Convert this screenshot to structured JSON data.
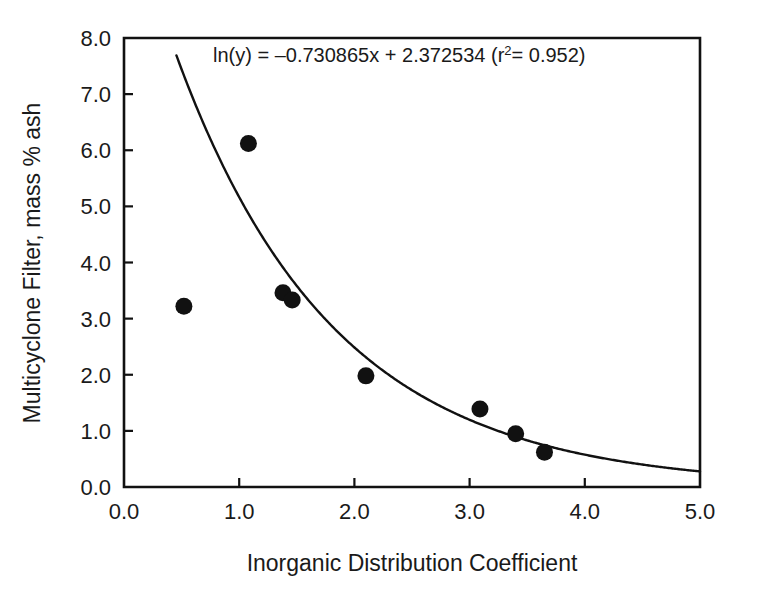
{
  "chart_data": {
    "type": "scatter",
    "title": "",
    "xlabel": "Inorganic Distribution Coefficient",
    "ylabel": "Multicyclone Filter, mass % ash",
    "xlim": [
      0.0,
      5.0
    ],
    "ylim": [
      0.0,
      8.0
    ],
    "xticks": [
      "0.0",
      "1.0",
      "2.0",
      "3.0",
      "4.0",
      "5.0"
    ],
    "xtick_values": [
      0.0,
      1.0,
      2.0,
      3.0,
      4.0,
      5.0
    ],
    "yticks": [
      "0.0",
      "1.0",
      "2.0",
      "3.0",
      "4.0",
      "5.0",
      "6.0",
      "7.0",
      "8.0"
    ],
    "ytick_values": [
      0.0,
      1.0,
      2.0,
      3.0,
      4.0,
      5.0,
      6.0,
      7.0,
      8.0
    ],
    "grid": false,
    "legend": "none",
    "points": [
      {
        "x": 0.52,
        "y": 3.22
      },
      {
        "x": 1.08,
        "y": 6.12
      },
      {
        "x": 1.38,
        "y": 3.46
      },
      {
        "x": 1.46,
        "y": 3.33
      },
      {
        "x": 2.1,
        "y": 1.98
      },
      {
        "x": 3.09,
        "y": 1.39
      },
      {
        "x": 3.4,
        "y": 0.95
      },
      {
        "x": 3.65,
        "y": 0.62
      }
    ],
    "fit": {
      "form": "exponential",
      "equation_text": "ln(y) = –0.730865x + 2.372534 (r",
      "equation_sup": "2",
      "equation_tail": "= 0.952)",
      "slope": -0.730865,
      "intercept": 2.372534,
      "r_squared": 0.952,
      "x_start": 0.455,
      "x_end": 5.0
    },
    "annotations": [
      {
        "text_main": "ln(y) = –0.730865x + 2.372534 (r",
        "text_sup": "2",
        "text_tail": "= 0.952)",
        "x_px": 213,
        "y_px": 62
      }
    ],
    "colors": {
      "axis": "#111111",
      "curve": "#111111",
      "marker": "#111111",
      "background": "#ffffff",
      "text": "#1a1a1a"
    }
  }
}
